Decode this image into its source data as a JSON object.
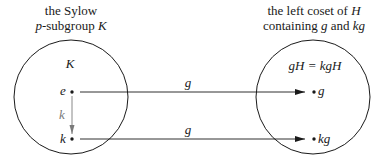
{
  "left_caption": {
    "line1": "the Sylow",
    "line2_var": "p",
    "line2_text": "-subgroup ",
    "line2_var2": "K"
  },
  "right_caption": {
    "line1_text": "the left coset of ",
    "line1_var": "H",
    "line2_text": "containing ",
    "line2_var1": "g",
    "line2_and": " and ",
    "line2_var2": "kg"
  },
  "left_set": {
    "label": "K",
    "points": [
      {
        "label": "e"
      },
      {
        "label": "k"
      }
    ],
    "internal_arrow_label": "k"
  },
  "right_set": {
    "label": "gH = kgH",
    "points": [
      {
        "label": "g"
      },
      {
        "label": "kg"
      }
    ]
  },
  "arrows": [
    {
      "from": "e",
      "to": "g",
      "label": "g"
    },
    {
      "from": "k",
      "to": "kg",
      "label": "g"
    }
  ],
  "colors": {
    "stroke": "#1a1a1a",
    "internal_arrow": "#7a7a7a"
  }
}
